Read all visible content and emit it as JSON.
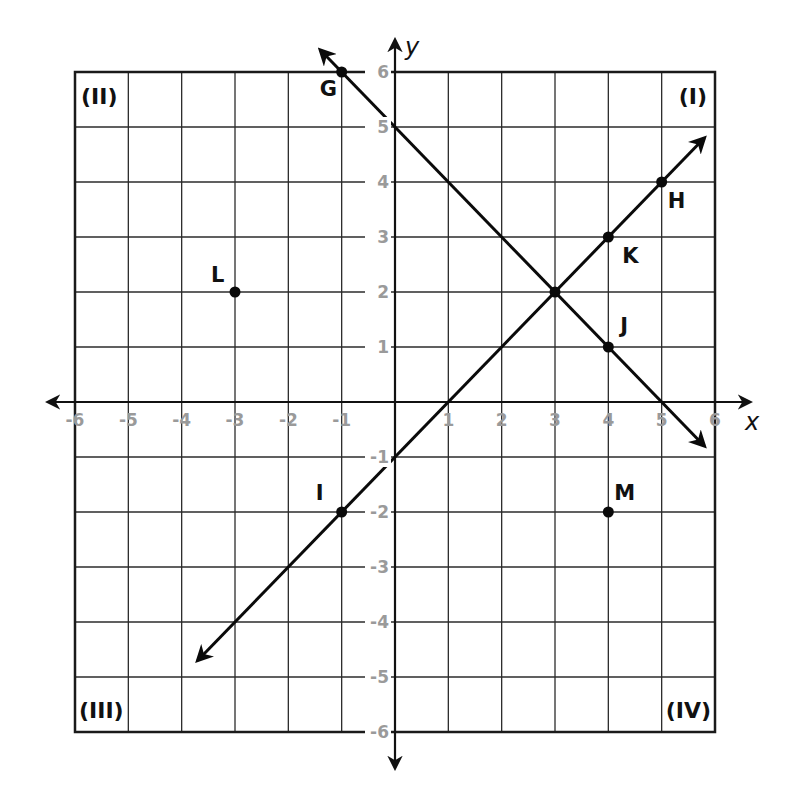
{
  "chart_data": {
    "type": "scatter",
    "title": "",
    "xlabel": "x",
    "ylabel": "y",
    "xlim": [
      -6,
      6
    ],
    "ylim": [
      -6,
      6
    ],
    "grid": true,
    "x_ticks": [
      -6,
      -5,
      -4,
      -3,
      -2,
      -1,
      1,
      2,
      3,
      4,
      5,
      6
    ],
    "y_ticks": [
      6,
      5,
      4,
      3,
      2,
      1,
      -1,
      -2,
      -3,
      -4,
      -5,
      -6
    ],
    "quadrant_labels": [
      {
        "label": "(I)",
        "position": "top-right"
      },
      {
        "label": "(II)",
        "position": "top-left"
      },
      {
        "label": "(III)",
        "position": "bottom-left"
      },
      {
        "label": "(IV)",
        "position": "bottom-right"
      }
    ],
    "points": [
      {
        "label": "G",
        "x": -1,
        "y": 6
      },
      {
        "label": "H",
        "x": 5,
        "y": 4
      },
      {
        "label": "I",
        "x": -1,
        "y": -2
      },
      {
        "label": "J",
        "x": 4,
        "y": 1
      },
      {
        "label": "K",
        "x": 4,
        "y": 3
      },
      {
        "label": "L",
        "x": -3,
        "y": 2
      },
      {
        "label": "M",
        "x": 4,
        "y": -2
      },
      {
        "label": "",
        "x": 3,
        "y": 2
      }
    ],
    "lines": [
      {
        "name": "line through I, K, H",
        "equation": "y = x - 1",
        "slope": 1,
        "intercept": -1,
        "from": [
          -3.7,
          -4.7
        ],
        "to": [
          5.8,
          4.8
        ],
        "arrows": "both"
      },
      {
        "name": "line through G, J",
        "equation": "y = -x + 5",
        "slope": -1,
        "intercept": 5,
        "from": [
          -1.4,
          6.4
        ],
        "to": [
          5.8,
          -0.8
        ],
        "arrows": "both"
      }
    ],
    "intersection": {
      "x": 3,
      "y": 2
    }
  }
}
